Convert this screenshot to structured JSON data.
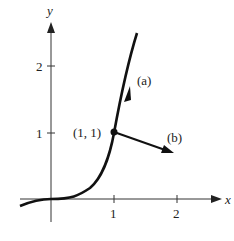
{
  "diagram": {
    "axes": {
      "x_label": "x",
      "y_label": "y",
      "x_ticks": [
        "1",
        "2"
      ],
      "y_ticks": [
        "1",
        "2"
      ]
    },
    "curve": "y = x^3",
    "point_label": "(1, 1)",
    "vectors": [
      {
        "label": "(a)",
        "description": "tangent vector along curve at (1,1)"
      },
      {
        "label": "(b)",
        "description": "normal vector at (1,1)"
      }
    ],
    "colors": {
      "ink": "#111111",
      "axis": "#333333"
    }
  }
}
